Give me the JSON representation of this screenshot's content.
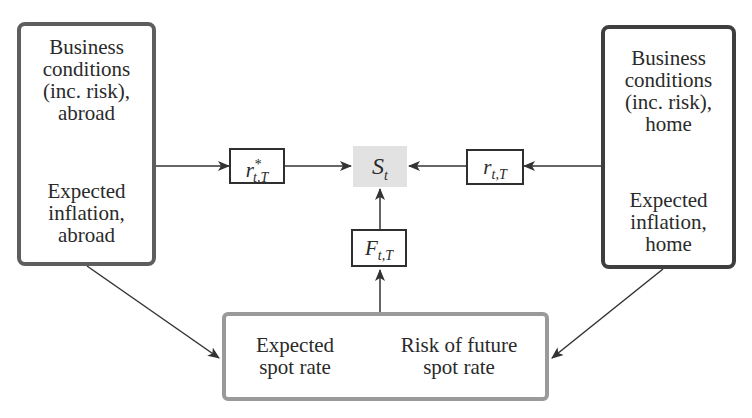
{
  "diagram": {
    "left_box": {
      "top_text": [
        "Business",
        "conditions",
        "(inc. risk),",
        "abroad"
      ],
      "bottom_text": [
        "Expected",
        "inflation,",
        "abroad"
      ]
    },
    "right_box": {
      "top_text": [
        "Business",
        "conditions",
        "(inc. risk),",
        "home"
      ],
      "bottom_text": [
        "Expected",
        "inflation,",
        "home"
      ]
    },
    "bottom_box": {
      "left_text": [
        "Expected",
        "spot rate"
      ],
      "right_text": [
        "Risk of future",
        "spot rate"
      ]
    },
    "nodes": {
      "foreign_rate": {
        "base": "r",
        "sup": "*",
        "sub": "t,T"
      },
      "spot_rate": {
        "base": "S",
        "sub": "t"
      },
      "home_rate": {
        "base": "r",
        "sub": "t,T"
      },
      "forward_rate": {
        "base": "F",
        "sub": "t,T"
      }
    },
    "colors": {
      "spot_fill": "#e2e2e2",
      "line": "#333333"
    }
  }
}
